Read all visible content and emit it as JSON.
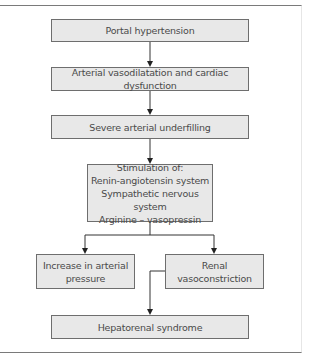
{
  "diagram": {
    "type": "flowchart",
    "nodes": [
      {
        "id": "portal_hypertension",
        "lines": [
          "Portal hypertension"
        ]
      },
      {
        "id": "arterial_vasodilatation",
        "lines": [
          "Arterial vasodilatation and cardiac dysfunction"
        ]
      },
      {
        "id": "arterial_underfilling",
        "lines": [
          "Severe arterial underfilling"
        ]
      },
      {
        "id": "stimulation",
        "lines": [
          "Stimulation of:",
          "Renin-angiotensin system",
          "Sympathetic nervous system",
          "Arginine – vasopressin"
        ]
      },
      {
        "id": "increase_pressure",
        "lines": [
          "Increase in arterial",
          "pressure"
        ]
      },
      {
        "id": "renal_vasoconstriction",
        "lines": [
          "Renal",
          "vasoconstriction"
        ]
      },
      {
        "id": "hepatorenal_syndrome",
        "lines": [
          "Hepatorenal syndrome"
        ]
      }
    ],
    "edges": [
      {
        "from": "portal_hypertension",
        "to": "arterial_vasodilatation"
      },
      {
        "from": "arterial_vasodilatation",
        "to": "arterial_underfilling"
      },
      {
        "from": "arterial_underfilling",
        "to": "stimulation"
      },
      {
        "from": "stimulation",
        "to": "increase_pressure"
      },
      {
        "from": "stimulation",
        "to": "renal_vasoconstriction"
      },
      {
        "from": "renal_vasoconstriction",
        "to": "hepatorenal_syndrome"
      }
    ],
    "colors": {
      "box_fill": "#e8e8e8",
      "box_border": "#6e6e6e",
      "line": "#333333",
      "text": "#4a4a4a"
    }
  }
}
